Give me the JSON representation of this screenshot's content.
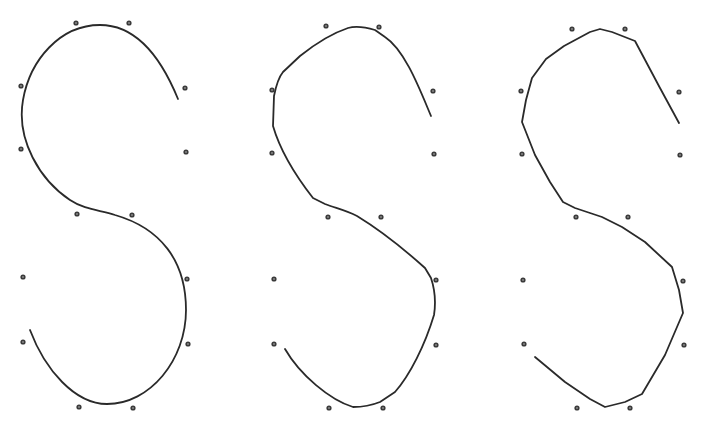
{
  "diagram": {
    "type": "spline-approximation-comparison",
    "colors": {
      "curve": "#2a2a2a",
      "point": "#3a3a3a",
      "background": "#ffffff"
    },
    "panels": [
      {
        "id": "panel-1",
        "style": "smooth",
        "control_points": [
          [
            76,
            23
          ],
          [
            129,
            23
          ],
          [
            21,
            86
          ],
          [
            185,
            88
          ],
          [
            21,
            149
          ],
          [
            186,
            152
          ],
          [
            77,
            214
          ],
          [
            132,
            215
          ],
          [
            23,
            277
          ],
          [
            187,
            279
          ],
          [
            23,
            342
          ],
          [
            188,
            344
          ],
          [
            79,
            407
          ],
          [
            133,
            408
          ]
        ],
        "curve": "M178,99 C160,55 135,25 100,25 C60,25 30,60 23,100 C16,140 40,180 70,200 C85,210 100,210 115,215 C160,228 186,260 186,310 C186,360 150,404 107,404 C75,404 45,370 30,330"
      },
      {
        "id": "panel-2",
        "style": "slightly-faceted",
        "control_points": [
          [
            326,
            26
          ],
          [
            379,
            27
          ],
          [
            272,
            90
          ],
          [
            433,
            91
          ],
          [
            272,
            153
          ],
          [
            434,
            154
          ],
          [
            328,
            217
          ],
          [
            381,
            217
          ],
          [
            274,
            279
          ],
          [
            436,
            280
          ],
          [
            274,
            344
          ],
          [
            436,
            345
          ],
          [
            329,
            408
          ],
          [
            383,
            408
          ]
        ],
        "curve": "M431,116 C420,90 405,50 385,37 L375,30 C365,27 355,26 348,28 C330,34 310,48 300,56 L283,72 C278,78 276,86 274,96 L273,126 C280,150 295,175 313,198 L325,204 C335,208 345,210 357,216 C380,230 405,250 425,268 L431,278 C435,290 436,302 434,315 C425,345 410,375 395,392 L380,402 C370,406 360,407 353,407 C330,400 300,375 285,349"
      },
      {
        "id": "panel-3",
        "style": "piecewise-linear",
        "control_points": [
          [
            572,
            29
          ],
          [
            625,
            29
          ],
          [
            521,
            91
          ],
          [
            679,
            92
          ],
          [
            522,
            154
          ],
          [
            680,
            155
          ],
          [
            576,
            217
          ],
          [
            628,
            217
          ],
          [
            523,
            280
          ],
          [
            683,
            281
          ],
          [
            524,
            344
          ],
          [
            684,
            345
          ],
          [
            577,
            408
          ],
          [
            630,
            408
          ]
        ],
        "curve": "M679,123 L660,88 L635,41 L612,32 L600,29 L590,32 L564,46 L546,59 L532,78 L526,100 L522,122 L535,155 L550,182 L563,202 L575,208 L590,213 L602,217 L622,227 L645,242 L672,267 L679,290 L683,313 L665,355 L642,394 L625,402 L605,407 L590,399 L565,382 L535,357"
      }
    ]
  }
}
